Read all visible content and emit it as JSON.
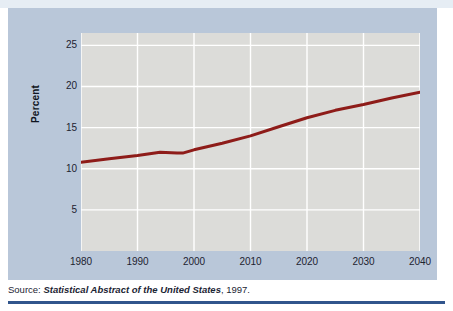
{
  "figure": {
    "source_note": {
      "label": "Source:",
      "title": "Statistical Abstract of the United States",
      "year": ", 1997."
    }
  },
  "colors": {
    "panel_background": "#b9c7d9",
    "plot_background": "#dcdcd9",
    "gridline": "#ffffff",
    "line_series": "#8e1c19",
    "rule": "#31558c",
    "text": "#1d2330"
  },
  "chart_data": {
    "type": "line",
    "title": "",
    "xlabel": "",
    "ylabel": "Percent",
    "xlim": [
      1980,
      2040
    ],
    "ylim": [
      0,
      26.5
    ],
    "grid": true,
    "legend": "none",
    "xticks": [
      1980,
      1990,
      2000,
      2010,
      2020,
      2030,
      2040
    ],
    "xtick_labels": [
      "1980",
      "1990",
      "2000",
      "2010",
      "2020",
      "2030",
      "2040"
    ],
    "yticks": [
      5,
      10,
      15,
      20,
      25
    ],
    "ytick_labels": [
      "5",
      "10",
      "15",
      "20",
      "25"
    ],
    "series": [
      {
        "name": "Percent",
        "color": "#8e1c19",
        "x": [
          1980,
          1985,
          1990,
          1994,
          1997,
          1998,
          2000,
          2005,
          2010,
          2015,
          2020,
          2025,
          2030,
          2035,
          2040
        ],
        "y": [
          10.8,
          11.2,
          11.6,
          12.0,
          11.9,
          11.9,
          12.3,
          13.1,
          14.0,
          15.1,
          16.2,
          17.1,
          17.8,
          18.6,
          19.3
        ]
      }
    ]
  }
}
